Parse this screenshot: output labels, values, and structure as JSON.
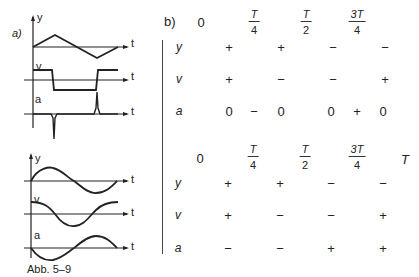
{
  "figure_a": {
    "label": "a)",
    "top_graphs": {
      "y_label": "y",
      "v_label": "v",
      "a_label": "a",
      "t_label": "t"
    },
    "bottom_graphs": {
      "y_label": "y",
      "v_label": "v",
      "a_label": "a",
      "t_label": "t"
    }
  },
  "figure_b": {
    "label": "b)",
    "top_table": {
      "header": [
        "0",
        {
          "num": "T",
          "den": "4"
        },
        {
          "num": "T",
          "den": "2"
        },
        {
          "num": "3T",
          "den": "4"
        },
        "T"
      ],
      "header_plain": {
        "c0": "0",
        "c1_num": "T",
        "c1_den": "4",
        "c2_num": "T",
        "c2_den": "2",
        "c3_num": "3T",
        "c3_den": "4"
      },
      "rows": [
        {
          "label": "y",
          "values": [
            "+",
            "+",
            "−",
            "−"
          ]
        },
        {
          "label": "v",
          "values": [
            "+",
            "−",
            "−",
            "+"
          ]
        },
        {
          "label": "a",
          "values": [
            "0",
            "−",
            "0",
            "0",
            "+",
            "0"
          ]
        }
      ]
    },
    "bottom_table": {
      "header_plain": {
        "c0": "0",
        "c1_num": "T",
        "c1_den": "4",
        "c2_num": "T",
        "c2_den": "2",
        "c3_num": "3T",
        "c3_den": "4",
        "c4": "T"
      },
      "rows": [
        {
          "label": "y",
          "values": [
            "+",
            "+",
            "−",
            "−"
          ]
        },
        {
          "label": "v",
          "values": [
            "+",
            "−",
            "−",
            "+"
          ]
        },
        {
          "label": "a",
          "values": [
            "−",
            "−",
            "+",
            "+"
          ]
        }
      ]
    }
  },
  "caption": "Abb. 5–9"
}
